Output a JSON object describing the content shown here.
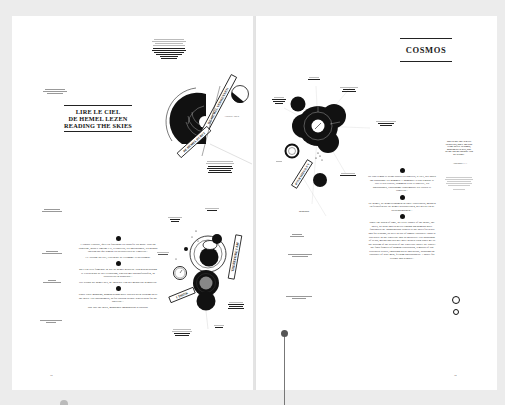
{
  "spread": {
    "left_page": {
      "title_lines": [
        "LIRE LE CIEL",
        "DE HEMEL LEZEN",
        "READING THE SKIES"
      ],
      "side_caption": "— · —",
      "diagram_banner_top": "DE HEMEL VERKENNEN",
      "diagram_banner_bottom": "DE HEMEL DURFT",
      "diagram_caption_bottom": "THE SKIES ARE FASCINATING FOR MEN AND PHILOSOPHERS",
      "diagram_caption_right": "Aristotle 350 b.",
      "diagram2_banner_right": "THEREFORE I AM",
      "diagram2_banner_left": "I THINK",
      "diagram2_caption": "DE HEMEL OUDE ZIEL",
      "page_number": "18",
      "body_paragraphs": [
        "L'espace exploré, qu'il est fascinant les stupéfie ou nous. Tout un concerne, nous y émerge-t-il, à l'univers, les philosophes, les grands chercheurs qui aiment les découvertes de l'univers...",
        "Le Voyage du ciel, l'aventure de l'Homme et du cosmos.",
        "Met een zeer filmende in wie de hemel geboeid. Van gebenedijding te Grieken nu de ster verbazing, tegelijk met natuurfilosofen, in voorzitters en studiebal...",
        "Het avond die hemel ster, de ontdekte van het menselijk denkbeeld.",
        "Since early mankind, human beings have always been looking up at the skies. For astronomers, as for curious people who search for the universe...",
        "Just like the skies, mankind's imagination is curious."
      ],
      "margin_notes": [
        "— · —",
        "— · —",
        "— · —",
        "— · —"
      ]
    },
    "right_page": {
      "title": "COSMOS",
      "diagram_banner": "POUR MIEUX S'Y",
      "diagram_caption_bottom": "NEWTON",
      "quote": "THE STARS ARE ALWAYS CONSTANT, THEY ARE THE SAME SPACE AT NIGHT, DIFFERENT AT DAY, THE STARS ARE BEAUTIFUL AND PEACEFUL.",
      "quote_attribution": "Anonymous 1.1.1",
      "page_number": "19",
      "body_paragraphs": [
        "De tout temps et avant toutes les lunettes, le ciel, ses astres ont passionné les hommes. L'humanité a tout regardé le ciel et ses étoiles, comment s'est-il observé, les philosophes, l'astronome contemplait les étoiles et l'univers...",
        "De hemel, de hemellichamen en onze voorvaders, mensen en filosofen die de hemel bestudeerden, het heelal en de sterrenkundigen...",
        "Since the dawn of time, in every corner of the globe, the skies, its stars and its never-ending phenomena have fascinated us. Mankind has looked to the skies for ways and for reasons, as well as out of simple curiosity: what is our place in the Universe and its galaxies? For thousands of years, myths and science have helped each other get to the bottom of the secrets of the Universe above us. Space: the final frontier of human exploration, a mirror of our terrestrial reality, inspiring poets and artists, arousing the curiosity of wise men, feeding philosophers. A space for vertigo and wonder..."
      ]
    }
  }
}
